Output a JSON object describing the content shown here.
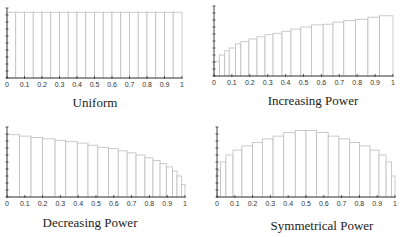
{
  "chart_data": [
    {
      "type": "bar",
      "title": "Uniform",
      "xlabel": "",
      "ylabel": "",
      "xlim": [
        0,
        1
      ],
      "ylim": [
        0,
        1
      ],
      "xticks": [
        "0",
        "0.1",
        "0.2",
        "0.3",
        "0.4",
        "0.5",
        "0.6",
        "0.7",
        "0.8",
        "0.9",
        "1"
      ],
      "bin_edges": [
        0,
        0.05,
        0.1,
        0.15,
        0.2,
        0.25,
        0.3,
        0.35,
        0.4,
        0.45,
        0.5,
        0.55,
        0.6,
        0.65,
        0.7,
        0.75,
        0.8,
        0.85,
        0.9,
        0.95,
        1
      ],
      "values": [
        0.94,
        0.94,
        0.94,
        0.94,
        0.94,
        0.94,
        0.94,
        0.94,
        0.94,
        0.94,
        0.94,
        0.94,
        0.94,
        0.94,
        0.94,
        0.94,
        0.94,
        0.94,
        0.94,
        0.94
      ]
    },
    {
      "type": "bar",
      "title": "Increasing Power",
      "xlabel": "",
      "ylabel": "",
      "xlim": [
        0,
        1
      ],
      "ylim": [
        0,
        1
      ],
      "xticks": [
        "0",
        "0.1",
        "0.2",
        "0.3",
        "0.4",
        "0.5",
        "0.6",
        "0.7",
        "0.8",
        "0.9",
        "1"
      ],
      "bin_edges": [
        0,
        0.03,
        0.06,
        0.085,
        0.12,
        0.15,
        0.195,
        0.24,
        0.285,
        0.33,
        0.38,
        0.43,
        0.485,
        0.545,
        0.61,
        0.665,
        0.725,
        0.79,
        0.86,
        0.925,
        1
      ],
      "values": [
        0.21,
        0.3,
        0.36,
        0.4,
        0.46,
        0.49,
        0.53,
        0.56,
        0.59,
        0.61,
        0.64,
        0.67,
        0.7,
        0.73,
        0.74,
        0.77,
        0.79,
        0.81,
        0.84,
        0.86
      ]
    },
    {
      "type": "bar",
      "title": "Decreasing Power",
      "xlabel": "",
      "ylabel": "",
      "xlim": [
        0,
        1
      ],
      "ylim": [
        0,
        1
      ],
      "xticks": [
        "0",
        "0.1",
        "0.2",
        "0.3",
        "0.4",
        "0.5",
        "0.6",
        "0.7",
        "0.8",
        "0.9",
        "1"
      ],
      "bin_edges": [
        0,
        0.07,
        0.135,
        0.2,
        0.27,
        0.33,
        0.395,
        0.455,
        0.51,
        0.57,
        0.625,
        0.675,
        0.725,
        0.775,
        0.82,
        0.86,
        0.895,
        0.93,
        0.955,
        0.98,
        1
      ],
      "values": [
        0.89,
        0.87,
        0.85,
        0.83,
        0.81,
        0.79,
        0.77,
        0.74,
        0.71,
        0.69,
        0.66,
        0.63,
        0.6,
        0.56,
        0.52,
        0.48,
        0.43,
        0.37,
        0.3,
        0.18
      ]
    },
    {
      "type": "bar",
      "title": "Symmetrical Power",
      "xlabel": "",
      "ylabel": "",
      "xlim": [
        0,
        1
      ],
      "ylim": [
        0,
        1
      ],
      "xticks": [
        "0",
        "0.1",
        "0.2",
        "0.3",
        "0.4",
        "0.5",
        "0.6",
        "0.7",
        "0.8",
        "0.9",
        "1"
      ],
      "bin_edges": [
        0,
        0.02,
        0.05,
        0.09,
        0.14,
        0.2,
        0.255,
        0.315,
        0.375,
        0.44,
        0.5,
        0.56,
        0.625,
        0.685,
        0.745,
        0.8,
        0.86,
        0.91,
        0.95,
        0.98,
        1
      ],
      "values": [
        0.38,
        0.5,
        0.6,
        0.67,
        0.73,
        0.78,
        0.83,
        0.87,
        0.92,
        0.95,
        0.95,
        0.92,
        0.87,
        0.83,
        0.78,
        0.73,
        0.67,
        0.6,
        0.5,
        0.3
      ]
    }
  ]
}
